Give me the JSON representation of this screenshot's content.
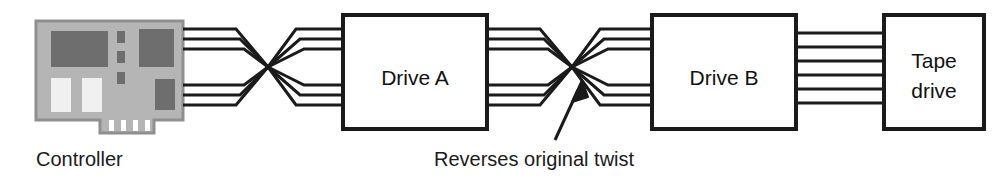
{
  "diagram": {
    "background_color": "#ffffff",
    "line_color": "#1a1a1a",
    "nodes": {
      "controller": {
        "label": "Controller",
        "type": "expansion-card",
        "board_color": "#b5b5b5",
        "board_border_color": "#8a8a8a",
        "chip_color": "#6e6e6e",
        "slot_color": "#f2f2f2",
        "finger_color": "#ffffff"
      },
      "drive_a": {
        "label": "Drive A",
        "type": "box",
        "fill": "#ffffff",
        "border": "#1a1a1a"
      },
      "drive_b": {
        "label": "Drive B",
        "type": "box",
        "fill": "#ffffff",
        "border": "#1a1a1a"
      },
      "tape_drive": {
        "label_line1": "Tape",
        "label_line2": "drive",
        "type": "box",
        "fill": "#ffffff",
        "border": "#1a1a1a"
      }
    },
    "annotation": {
      "caption": "Reverses original twist",
      "arrow": "arrow-up-right"
    },
    "cable": {
      "conductors_per_group": 3,
      "total_conductors": 6,
      "segments": [
        {
          "name": "controller-to-twist1",
          "twisted": true
        },
        {
          "name": "twist1-to-drive-a",
          "twisted": false
        },
        {
          "name": "drive-a-to-twist2",
          "twisted": true
        },
        {
          "name": "twist2-to-drive-b",
          "twisted": false
        },
        {
          "name": "drive-b-to-tape-drive",
          "twisted": false
        }
      ]
    }
  }
}
